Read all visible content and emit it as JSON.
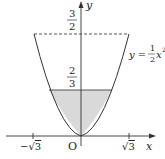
{
  "diagram": {
    "type": "function-graph",
    "curve": {
      "equation_label_prefix": "y =",
      "coef_num": "1",
      "coef_den": "2",
      "var": "x",
      "exp": "2"
    },
    "axes": {
      "x_label": "x",
      "y_label": "y",
      "origin_label": "O"
    },
    "x_ticks": [
      {
        "label_sign": "−",
        "label_root": "√",
        "label_value": "3"
      },
      {
        "label_sign": "",
        "label_root": "√",
        "label_value": "3"
      }
    ],
    "y_levels": {
      "dashed_level": {
        "num": "3",
        "den": "2"
      },
      "shaded_level": {
        "num": "2",
        "den": "3"
      }
    },
    "colors": {
      "line": "#333333",
      "shade": "#d9d9d9",
      "text": "#222222"
    }
  }
}
